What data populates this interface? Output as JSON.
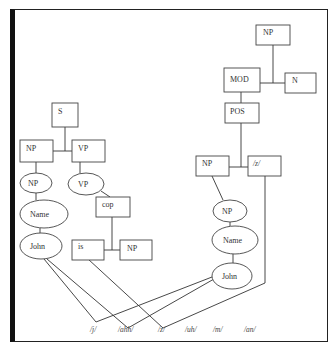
{
  "diagram": {
    "left_tree": {
      "root": "S",
      "np": "NP",
      "vp": "VP",
      "np_ellipse": "NP",
      "vp_ellipse": "VP",
      "name_ellipse": "Name",
      "john_ellipse": "John",
      "cop": "cop",
      "is": "is",
      "np_obj": "NP"
    },
    "right_tree": {
      "root": "NP",
      "mod": "MOD",
      "n": "N",
      "pos": "POS",
      "np": "NP",
      "z_box": "/z/",
      "np_ellipse": "NP",
      "name_ellipse": "Name",
      "john_ellipse": "John"
    },
    "phonemes": [
      "/j/",
      "/ahh/",
      "/z/",
      "/uh/",
      "/m/",
      "/an/"
    ]
  }
}
